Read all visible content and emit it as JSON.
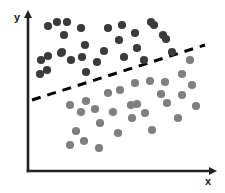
{
  "figure": {
    "title": "",
    "background_color": "#ffffff"
  },
  "axes": {
    "y_label": "y",
    "x_label": "x",
    "axis_color": "#222222",
    "y_axis": {
      "x": 28,
      "y_top": 16,
      "y_bottom": 171
    },
    "x_axis": {
      "y": 171,
      "x_left": 28,
      "x_right": 211
    }
  },
  "boundary": {
    "name": "decision-boundary",
    "style": "dashed",
    "color": "#000000",
    "width": 3,
    "dash": "9 7",
    "x1": 32,
    "y1": 100,
    "x2": 205,
    "y2": 45
  },
  "chart_data": {
    "type": "scatter",
    "title": "",
    "xlabel": "x",
    "ylabel": "y",
    "grid": false,
    "legend": "none",
    "axis_ranges": {
      "xlim": [
        28,
        211
      ],
      "ylim": [
        16,
        171
      ]
    },
    "annotations": [
      {
        "type": "line",
        "label": "decision boundary",
        "style": "dashed",
        "from": [
          32,
          100
        ],
        "to": [
          205,
          45
        ]
      }
    ],
    "series": [
      {
        "name": "Class A (above boundary)",
        "color": "#3b3b3b",
        "marker": "circle",
        "marker_size": 5,
        "points": [
          [
            57,
            22
          ],
          [
            48,
            26
          ],
          [
            67,
            22
          ],
          [
            81,
            28
          ],
          [
            64,
            35
          ],
          [
            85,
            45
          ],
          [
            61,
            53
          ],
          [
            108,
            28
          ],
          [
            122,
            25
          ],
          [
            135,
            33
          ],
          [
            151,
            22
          ],
          [
            119,
            40
          ],
          [
            137,
            48
          ],
          [
            104,
            51
          ],
          [
            163,
            35
          ],
          [
            154,
            25
          ],
          [
            48,
            56
          ],
          [
            62,
            52
          ],
          [
            71,
            60
          ],
          [
            82,
            57
          ],
          [
            47,
            70
          ],
          [
            86,
            72
          ],
          [
            97,
            62
          ],
          [
            124,
            57
          ],
          [
            144,
            60
          ],
          [
            166,
            39
          ],
          [
            172,
            52
          ],
          [
            41,
            60
          ],
          [
            40,
            74
          ]
        ]
      },
      {
        "name": "Class B (below boundary)",
        "color": "#7f7f7f",
        "marker": "circle",
        "marker_size": 5,
        "points": [
          [
            182,
            74
          ],
          [
            135,
            83
          ],
          [
            150,
            81
          ],
          [
            165,
            82
          ],
          [
            161,
            94
          ],
          [
            182,
            95
          ],
          [
            137,
            104
          ],
          [
            167,
            103
          ],
          [
            145,
            113
          ],
          [
            132,
            118
          ],
          [
            178,
            118
          ],
          [
            152,
            130
          ],
          [
            70,
            105
          ],
          [
            86,
            101
          ],
          [
            95,
            109
          ],
          [
            108,
            93
          ],
          [
            81,
            112
          ],
          [
            120,
            90
          ],
          [
            100,
            123
          ],
          [
            76,
            131
          ],
          [
            84,
            141
          ],
          [
            118,
            133
          ],
          [
            70,
            145
          ],
          [
            99,
            148
          ],
          [
            131,
            105
          ],
          [
            113,
            112
          ],
          [
            192,
            85
          ],
          [
            196,
            106
          ],
          [
            190,
            60
          ]
        ]
      }
    ]
  }
}
